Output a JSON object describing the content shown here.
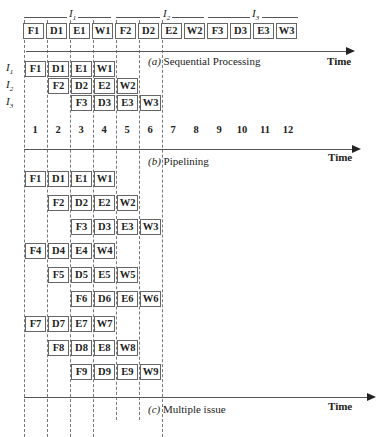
{
  "chart_data": {
    "type": "diagram",
    "stages": [
      "F",
      "D",
      "E",
      "W"
    ],
    "sections": [
      {
        "id": "a",
        "caption_letter": "(a)",
        "caption_text": "Sequential Processing",
        "axis_label": "Time",
        "instruction_groups": [
          {
            "label": "I",
            "sub": "1",
            "boxes": [
              "F1",
              "D1",
              "E1",
              "W1"
            ]
          },
          {
            "label": "I",
            "sub": "2",
            "boxes": [
              "F2",
              "D2",
              "E2",
              "W2"
            ]
          },
          {
            "label": "I",
            "sub": "3",
            "boxes": [
              "F3",
              "D3",
              "E3",
              "W3"
            ]
          }
        ]
      },
      {
        "id": "b",
        "caption_letter": "(b)",
        "caption_text": "Pipelining",
        "axis_label": "Time",
        "time_ticks": [
          "1",
          "2",
          "3",
          "4",
          "5",
          "6",
          "7",
          "8",
          "9",
          "10",
          "11",
          "12"
        ],
        "rows": [
          {
            "label": "I",
            "sub": "1",
            "boxes": [
              {
                "t": 1,
                "s": "F1"
              },
              {
                "t": 2,
                "s": "D1"
              },
              {
                "t": 3,
                "s": "E1"
              },
              {
                "t": 4,
                "s": "W1"
              }
            ]
          },
          {
            "label": "I",
            "sub": "2",
            "boxes": [
              {
                "t": 2,
                "s": "F2"
              },
              {
                "t": 3,
                "s": "D2"
              },
              {
                "t": 4,
                "s": "E2"
              },
              {
                "t": 5,
                "s": "W2"
              }
            ]
          },
          {
            "label": "I",
            "sub": "3",
            "boxes": [
              {
                "t": 3,
                "s": "F3"
              },
              {
                "t": 4,
                "s": "D3"
              },
              {
                "t": 5,
                "s": "E3"
              },
              {
                "t": 6,
                "s": "W3"
              }
            ]
          }
        ]
      },
      {
        "id": "c",
        "caption_letter": "(c)",
        "caption_text": "Multiple issue",
        "axis_label": "Time",
        "rows": [
          {
            "boxes": [
              {
                "t": 1,
                "s": "F1"
              },
              {
                "t": 2,
                "s": "D1"
              },
              {
                "t": 3,
                "s": "E1"
              },
              {
                "t": 4,
                "s": "W1"
              }
            ]
          },
          {
            "boxes": [
              {
                "t": 2,
                "s": "F2"
              },
              {
                "t": 3,
                "s": "D2"
              },
              {
                "t": 4,
                "s": "E2"
              },
              {
                "t": 5,
                "s": "W2"
              }
            ]
          },
          {
            "boxes": [
              {
                "t": 3,
                "s": "F3"
              },
              {
                "t": 4,
                "s": "D3"
              },
              {
                "t": 5,
                "s": "E3"
              },
              {
                "t": 6,
                "s": "W3"
              }
            ]
          },
          {
            "boxes": [
              {
                "t": 1,
                "s": "F4"
              },
              {
                "t": 2,
                "s": "D4"
              },
              {
                "t": 3,
                "s": "E4"
              },
              {
                "t": 4,
                "s": "W4"
              }
            ]
          },
          {
            "boxes": [
              {
                "t": 2,
                "s": "F5"
              },
              {
                "t": 3,
                "s": "D5"
              },
              {
                "t": 4,
                "s": "E5"
              },
              {
                "t": 5,
                "s": "W5"
              }
            ]
          },
          {
            "boxes": [
              {
                "t": 3,
                "s": "F6"
              },
              {
                "t": 4,
                "s": "D6"
              },
              {
                "t": 5,
                "s": "E6"
              },
              {
                "t": 6,
                "s": "W6"
              }
            ]
          },
          {
            "boxes": [
              {
                "t": 1,
                "s": "F7"
              },
              {
                "t": 2,
                "s": "D7"
              },
              {
                "t": 3,
                "s": "E7"
              },
              {
                "t": 4,
                "s": "W7"
              }
            ]
          },
          {
            "boxes": [
              {
                "t": 2,
                "s": "F8"
              },
              {
                "t": 3,
                "s": "D8"
              },
              {
                "t": 4,
                "s": "E8"
              },
              {
                "t": 5,
                "s": "W8"
              }
            ]
          },
          {
            "boxes": [
              {
                "t": 3,
                "s": "F9"
              },
              {
                "t": 4,
                "s": "D9"
              },
              {
                "t": 5,
                "s": "E9"
              },
              {
                "t": 6,
                "s": "W9"
              }
            ]
          }
        ]
      }
    ]
  },
  "labels": {
    "time": "Time",
    "seq_letter": "(a)",
    "seq_text": "Sequential Processing",
    "pipe_letter": "(b)",
    "pipe_text": "Pipelining",
    "multi_letter": "(c)",
    "multi_text": "Multiple issue",
    "I": "I",
    "s1": "1",
    "s2": "2",
    "s3": "3"
  }
}
